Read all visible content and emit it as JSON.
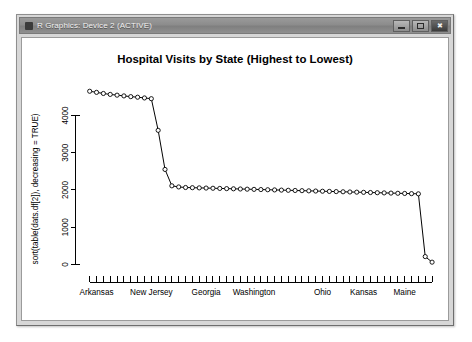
{
  "window": {
    "title": "R Graphics: Device 2 (ACTIVE)",
    "icon": "r-logo-icon",
    "controls": {
      "minimize_label": "—",
      "maximize_label": "□",
      "close_label": "✖"
    }
  },
  "chart_data": {
    "type": "line",
    "title": "Hospital Visits by State (Highest to Lowest)",
    "xlabel": "",
    "ylabel": "sort(table(dats.df[2]), decreasing = TRUE)",
    "ylim": [
      0,
      4800
    ],
    "yticks": [
      0,
      1000,
      2000,
      3000,
      4000
    ],
    "ytick_labels": [
      "0",
      "1000",
      "2000",
      "3000",
      "4000"
    ],
    "grid": false,
    "legend": "none",
    "marker": "open-circle",
    "n_points": 51,
    "xtick_count": 51,
    "xtick_labels": [
      "Arkansas",
      "New Jersey",
      "Georgia",
      "Washington",
      "Ohio",
      "Kansas",
      "Maine"
    ],
    "xtick_label_positions": [
      1,
      9,
      17,
      24,
      34,
      40,
      46
    ],
    "categories": [
      "Arkansas",
      "Alabama",
      "Alaska",
      "Arizona",
      "California",
      "Colorado",
      "Connecticut",
      "Delaware",
      "Florida",
      "New Jersey",
      "Hawaii",
      "Idaho",
      "Illinois",
      "Indiana",
      "Iowa",
      "Louisiana",
      "Maryland",
      "Georgia",
      "Massachusetts",
      "Michigan",
      "Minnesota",
      "Mississippi",
      "Missouri",
      "Washington",
      "Montana",
      "Nebraska",
      "Nevada",
      "New Hampshire",
      "New Mexico",
      "New York",
      "North Carolina",
      "North Dakota",
      "Oklahoma",
      "Ohio",
      "Oregon",
      "Pennsylvania",
      "Rhode Island",
      "South Carolina",
      "South Dakota",
      "Kansas",
      "Tennessee",
      "Texas",
      "Utah",
      "Vermont",
      "Virginia",
      "Maine",
      "West Virginia",
      "Wisconsin",
      "Wyoming",
      "Puerto Rico",
      "Guam"
    ],
    "values": [
      4650,
      4620,
      4590,
      4565,
      4545,
      4525,
      4505,
      4490,
      4470,
      4450,
      3600,
      2550,
      2110,
      2080,
      2065,
      2060,
      2055,
      2050,
      2045,
      2040,
      2035,
      2030,
      2025,
      2020,
      2015,
      2010,
      2005,
      2000,
      1995,
      1990,
      1985,
      1980,
      1975,
      1970,
      1965,
      1960,
      1955,
      1950,
      1945,
      1940,
      1935,
      1930,
      1925,
      1920,
      1915,
      1910,
      1905,
      1900,
      1895,
      210,
      60
    ]
  },
  "colors": {
    "line": "#000000",
    "marker_fill": "#ffffff",
    "canvas": "#ffffff",
    "window_frame": "#d7d7d7",
    "title_bar": "#8c8c8c"
  }
}
